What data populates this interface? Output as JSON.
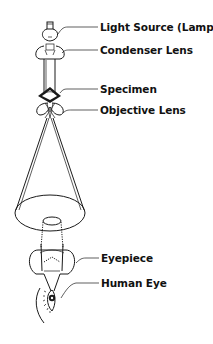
{
  "diagram": {
    "labels": [
      {
        "id": "light-source",
        "text": "Light Source (Lamp)",
        "x": 100,
        "y": 22
      },
      {
        "id": "condenser-lens",
        "text": "Condenser Lens",
        "x": 100,
        "y": 45
      },
      {
        "id": "specimen",
        "text": "Specimen",
        "x": 100,
        "y": 84
      },
      {
        "id": "objective-lens",
        "text": "Objective Lens",
        "x": 100,
        "y": 105
      },
      {
        "id": "eyepiece",
        "text": "Eyepiece",
        "x": 101,
        "y": 253
      },
      {
        "id": "human-eye",
        "text": "Human Eye",
        "x": 101,
        "y": 277
      }
    ],
    "colors": {
      "line": "#1a1a1a",
      "text": "#111111",
      "background": "#ffffff"
    }
  }
}
